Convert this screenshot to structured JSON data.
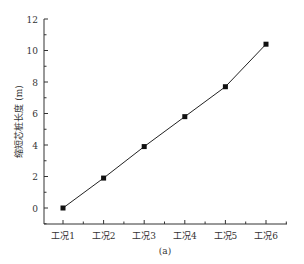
{
  "chart_data": {
    "type": "line",
    "title": "",
    "caption": "(a)",
    "xlabel": "",
    "ylabel": "缩短芯桩长度 (m)",
    "categories": [
      "工况1",
      "工况2",
      "工况3",
      "工况4",
      "工况5",
      "工况6"
    ],
    "series": [
      {
        "name": "缩短芯桩长度",
        "values": [
          0,
          1.9,
          3.9,
          5.8,
          7.7,
          10.4
        ],
        "marker": "square",
        "color": "#222222"
      }
    ],
    "ylim": [
      -0.9,
      12
    ],
    "yticks": [
      0,
      2,
      4,
      6,
      8,
      10,
      12
    ],
    "grid": false,
    "legend": "none"
  }
}
